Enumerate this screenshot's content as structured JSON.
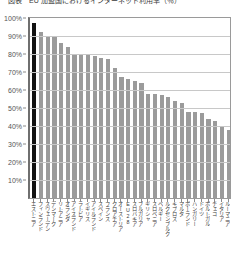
{
  "chart_data": {
    "type": "bar",
    "title": "図表　EU 加盟国におけるインターネット利用率（％）",
    "xlabel": "",
    "ylabel": "",
    "ylim": [
      0,
      100
    ],
    "ytick_labels": [
      "100%",
      "90%",
      "80%",
      "70%",
      "60%",
      "50%",
      "40%",
      "30%",
      "20%",
      "10%",
      "0%"
    ],
    "ytick_values": [
      100,
      90,
      80,
      70,
      60,
      50,
      40,
      30,
      20,
      10,
      0
    ],
    "grid": true,
    "legend": "none",
    "highlight_category": "エストニア",
    "highlight_color": "#121212",
    "bar_color": "#9b9b9b",
    "categories": [
      "エストニア",
      "フィンランド",
      "スウェーデン",
      "デンマーク",
      "リトアニア",
      "オランダ",
      "アイスランド",
      "ラトビア",
      "イギリス",
      "アイルランド",
      "スペイン",
      "フランス",
      "クロアチア",
      "オーストリア",
      "EU28",
      "スロバキア",
      "ブルガリア",
      "ギリシャ",
      "スロベニア",
      "ベルギー",
      "ルクセンブルク",
      "キプロス",
      "マルタ",
      "ポーランド",
      "ハンガリー",
      "ドイツ",
      "ポルトガル",
      "チェコ",
      "イタリア",
      "ルーマニア"
    ],
    "values": [
      97,
      92,
      90,
      90,
      86,
      84,
      80,
      80,
      80,
      79,
      78,
      77,
      72,
      67,
      66,
      65,
      64,
      58,
      58,
      57,
      56,
      54,
      53,
      48,
      48,
      47,
      44,
      43,
      40,
      38
    ]
  }
}
